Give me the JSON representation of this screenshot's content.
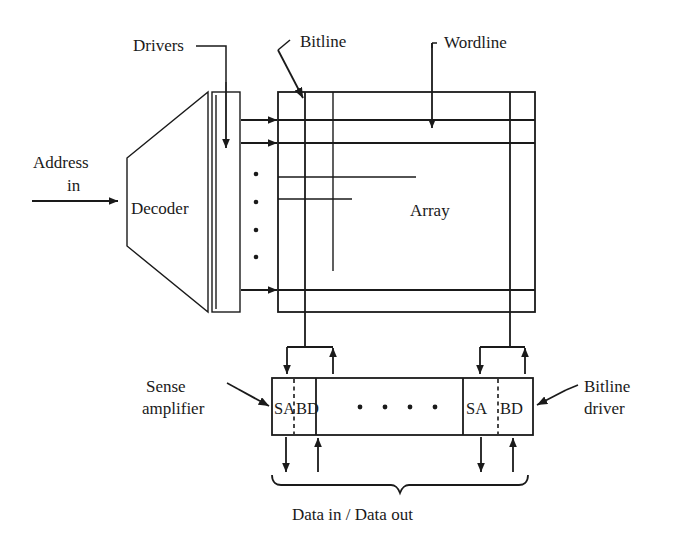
{
  "figure": {
    "type": "block-diagram",
    "background_color": "#ffffff",
    "line_color": "#1a1a1a"
  },
  "labels": {
    "address_in_line1": "Address",
    "address_in_line2": "in",
    "decoder": "Decoder",
    "drivers": "Drivers",
    "bitline": "Bitline",
    "wordline": "Wordline",
    "array": "Array",
    "sense_amplifier_line1": "Sense",
    "sense_amplifier_line2": "amplifier",
    "bitline_driver_line1": "Bitline",
    "bitline_driver_line2": "driver",
    "data_in_out": "Data in / Data out"
  },
  "io_blocks": {
    "left": {
      "sense_amp": "SA",
      "bitline_driver": "BD"
    },
    "right": {
      "sense_amp": "SA",
      "bitline_driver": "BD"
    },
    "ellipsis_dot_count": 4
  },
  "decoder_output_rows": {
    "arrow_count": 3,
    "vertical_ellipsis_dot_count": 4
  },
  "array_grid": {
    "bitline_count": 3,
    "wordline_count": 5
  }
}
